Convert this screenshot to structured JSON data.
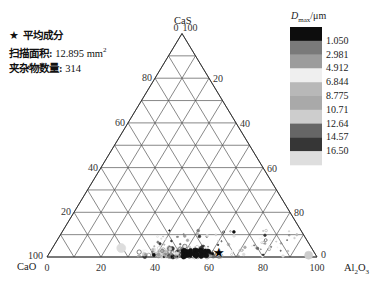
{
  "info": {
    "mean_label": "平均成分",
    "area_label": "扫描面积:",
    "area_value": "12.895",
    "area_unit": "mm",
    "area_sup": "2",
    "count_label": "夹杂物数量:",
    "count_value": "314"
  },
  "legend": {
    "title_main": "D",
    "title_sub": "max",
    "title_unit": "/μm",
    "labels": [
      "1.050",
      "2.981",
      "4.912",
      "6.844",
      "8.775",
      "10.71",
      "12.64",
      "14.57",
      "16.50"
    ],
    "colors": [
      "#0d0d0d",
      "#7a7a7a",
      "#9c9c9c",
      "#efefef",
      "#b8b8b8",
      "#a9a9a9",
      "#cdcdcd",
      "#666666",
      "#363636",
      "#dedede"
    ]
  },
  "chart_data": {
    "type": "scatter",
    "subtype": "ternary",
    "title": "",
    "axes": {
      "top": "CaS",
      "left": "CaO",
      "right": "Al2O3"
    },
    "ticks": [
      0,
      20,
      40,
      60,
      80,
      100
    ],
    "grid_step": 10,
    "grid": true,
    "legend_position": "top-right",
    "color_variable": "Dmax (μm)",
    "mean_point": {
      "CaO": 35,
      "Al2O3": 63,
      "CaS": 2
    },
    "scan_area_mm2": 12.895,
    "inclusion_count": 314,
    "clusters": [
      {
        "note": "dense cluster",
        "Al2O3_range": [
          45,
          72
        ],
        "CaS_range": [
          0,
          8
        ]
      },
      {
        "note": "sparse points",
        "Al2O3_range": [
          35,
          90
        ],
        "CaS_range": [
          0,
          12
        ]
      },
      {
        "note": "light blob near pure Al2O3",
        "Al2O3_range": [
          95,
          99
        ],
        "CaS_range": [
          0,
          2
        ]
      },
      {
        "note": "faint large particle",
        "Al2O3_range": [
          24,
          27
        ],
        "CaS_range": [
          3,
          5
        ]
      }
    ]
  }
}
